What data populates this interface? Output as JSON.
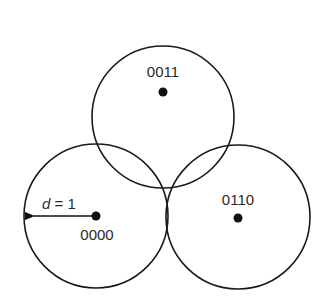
{
  "diagram": {
    "nodes": [
      {
        "id": "top",
        "label": "0011",
        "cx": 163,
        "cy": 117,
        "r": 71
      },
      {
        "id": "left",
        "label": "0000",
        "cx": 96,
        "cy": 216,
        "r": 72
      },
      {
        "id": "right",
        "label": "0110",
        "cx": 238,
        "cy": 217,
        "r": 72
      }
    ],
    "radius_label": {
      "var": "d",
      "eq": " = 1"
    },
    "colors": {
      "stroke": "#1a1a1a",
      "text": "#2a2a2a",
      "background": "#ffffff"
    }
  }
}
